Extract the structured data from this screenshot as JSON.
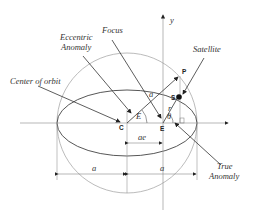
{
  "diagram": {
    "labels": {
      "y_axis": "y",
      "focus": "Focus",
      "eccentric_anomaly_1": "Eccentric",
      "eccentric_anomaly_2": "Anomaly",
      "satellite": "Satellite",
      "center_of_orbit": "Center of orbit",
      "true_anomaly_1": "True",
      "true_anomaly_2": "Anomaly",
      "point_c": "C",
      "point_e": "E",
      "point_s": "S",
      "point_p": "P",
      "angle_E": "E",
      "angle_theta": "θ",
      "radius_a": "a",
      "radius_r": "r",
      "dist_ae": "ae",
      "semi_major_left": "a",
      "semi_major_right": "a"
    },
    "colors": {
      "line": "#333333",
      "circle": "#aaaaaa",
      "axis": "#999999"
    }
  }
}
